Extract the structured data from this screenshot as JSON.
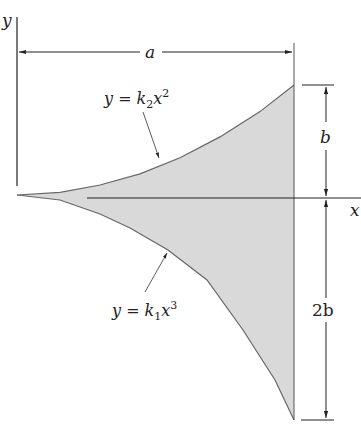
{
  "diagram": {
    "axes": {
      "x_label": "x",
      "y_label": "y"
    },
    "dimensions": {
      "width_label": "a",
      "upper_height_label": "b",
      "lower_height_label": "2b"
    },
    "curves": {
      "upper": {
        "lhs": "y = k",
        "sub": "2",
        "var": "x",
        "sup": "2"
      },
      "lower": {
        "lhs": "y = k",
        "sub": "1",
        "var": "x",
        "sup": "3"
      }
    },
    "colors": {
      "fill": "#d9d9d9",
      "stroke": "#555555",
      "line": "#222222"
    }
  }
}
